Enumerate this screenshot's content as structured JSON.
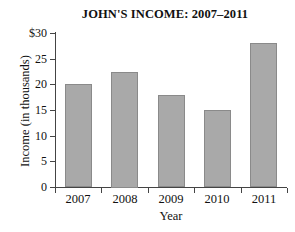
{
  "chart_data": {
    "type": "bar",
    "title": "JOHN'S INCOME: 2007–2011",
    "xlabel": "Year",
    "ylabel": "Income  (in thousands)",
    "categories": [
      "2007",
      "2008",
      "2009",
      "2010",
      "2011"
    ],
    "values": [
      20,
      22.5,
      18,
      15,
      28
    ],
    "ylim": [
      0,
      30
    ],
    "ytick_values": [
      0,
      5,
      10,
      15,
      20,
      25,
      30
    ],
    "ytick_labels": [
      "0",
      "5",
      "10",
      "15",
      "20",
      "25",
      "$30"
    ],
    "grid": false,
    "legend": null,
    "bar_color": "#a9a9a9",
    "bar_edge_color": "#8a8a8a",
    "axis_color": "#444444",
    "background": "#ffffff"
  }
}
